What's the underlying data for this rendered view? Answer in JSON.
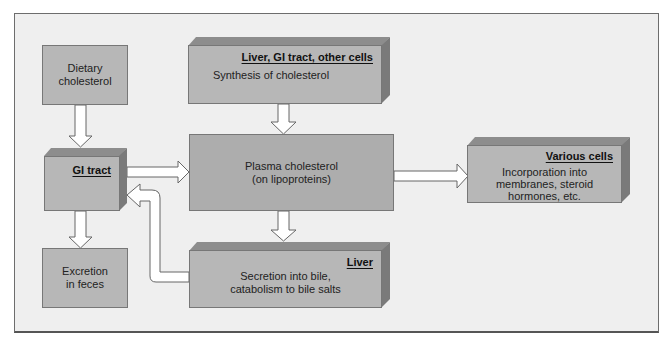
{
  "diagram": {
    "nodes": {
      "dietary": {
        "label_line1": "Dietary",
        "label_line2": "cholesterol"
      },
      "gi_tract": {
        "header": "GI tract"
      },
      "excretion": {
        "label_line1": "Excretion",
        "label_line2": "in feces"
      },
      "synthesis": {
        "header": "Liver, GI tract, other cells",
        "label": "Synthesis of cholesterol"
      },
      "plasma": {
        "label_line1": "Plasma cholesterol",
        "label_line2": "(on lipoproteins)"
      },
      "liver": {
        "header": "Liver",
        "label_line1": "Secretion into bile,",
        "label_line2": "catabolism to bile salts"
      },
      "various_cells": {
        "header": "Various cells",
        "label_line1": "Incorporation into",
        "label_line2": "membranes, steroid",
        "label_line3": "hormones, etc."
      }
    },
    "edges": [
      {
        "from": "dietary",
        "to": "gi_tract"
      },
      {
        "from": "gi_tract",
        "to": "plasma"
      },
      {
        "from": "gi_tract",
        "to": "excretion"
      },
      {
        "from": "synthesis",
        "to": "plasma"
      },
      {
        "from": "plasma",
        "to": "various_cells"
      },
      {
        "from": "plasma",
        "to": "liver"
      },
      {
        "from": "liver",
        "to": "gi_tract"
      }
    ],
    "colors": {
      "box_fill": "#b7b7b7",
      "box_top": "#8d8d8d",
      "box_side": "#7a7a7a",
      "background": "#efefef",
      "arrow_fill": "#ffffff"
    }
  }
}
